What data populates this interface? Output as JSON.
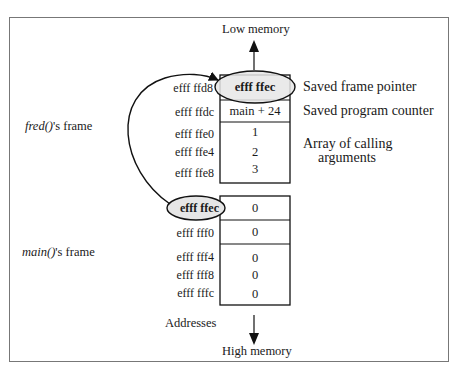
{
  "diagram": {
    "top_label": "Low memory",
    "bottom_label": "High memory",
    "addresses_label": "Addresses",
    "fred_frame": {
      "func": "fred()",
      "suffix": "'s frame",
      "rows": [
        {
          "address": "efff ffd8",
          "value": "efff ffec",
          "highlight": true
        },
        {
          "address": "efff ffdc",
          "value": "main + 24"
        },
        {
          "address": "efff ffe0",
          "value": "1"
        },
        {
          "address": "efff ffe4",
          "value": "2"
        },
        {
          "address": "efff ffe8",
          "value": "3"
        }
      ],
      "annotations": {
        "saved_frame_pointer": "Saved frame pointer",
        "saved_program_counter": "Saved program counter",
        "array_line1": "Array of calling",
        "array_line2": "arguments"
      }
    },
    "main_frame": {
      "func": "main()",
      "suffix": "'s frame",
      "rows": [
        {
          "address": "efff ffec",
          "value": "0",
          "highlight": true
        },
        {
          "address": "efff fff0",
          "value": "0"
        },
        {
          "address": "efff fff4",
          "value": "0"
        },
        {
          "address": "efff fff8",
          "value": "0"
        },
        {
          "address": "efff fffc",
          "value": "0"
        }
      ]
    },
    "colors": {
      "stroke": "#111111",
      "highlight_fill": "#e6e6e6",
      "frame_border": "#777777"
    }
  }
}
